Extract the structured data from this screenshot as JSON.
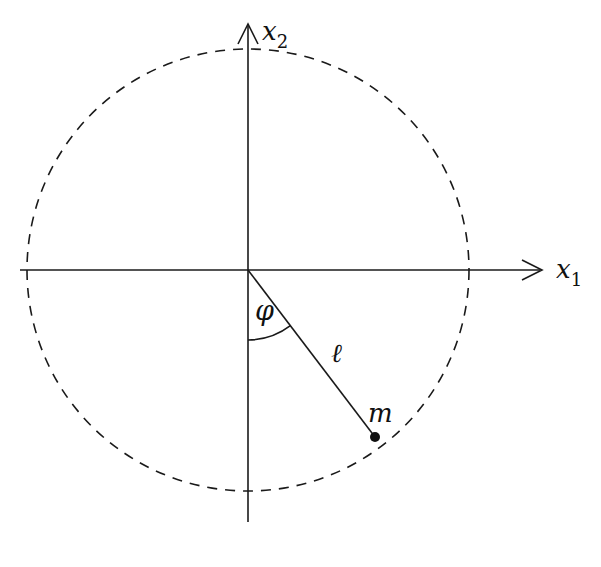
{
  "diagram": {
    "type": "pendulum-coordinate-diagram",
    "colors": {
      "stroke": "#1a1a1a",
      "background": "#ffffff"
    },
    "axes": {
      "horizontal": {
        "label": "x",
        "subscript": "1"
      },
      "vertical": {
        "label": "x",
        "subscript": "2"
      }
    },
    "circle": {
      "style": "dashed",
      "meaning": "trajectory of mass"
    },
    "labels": {
      "angle": "φ",
      "length": "ℓ",
      "mass": "m"
    }
  }
}
